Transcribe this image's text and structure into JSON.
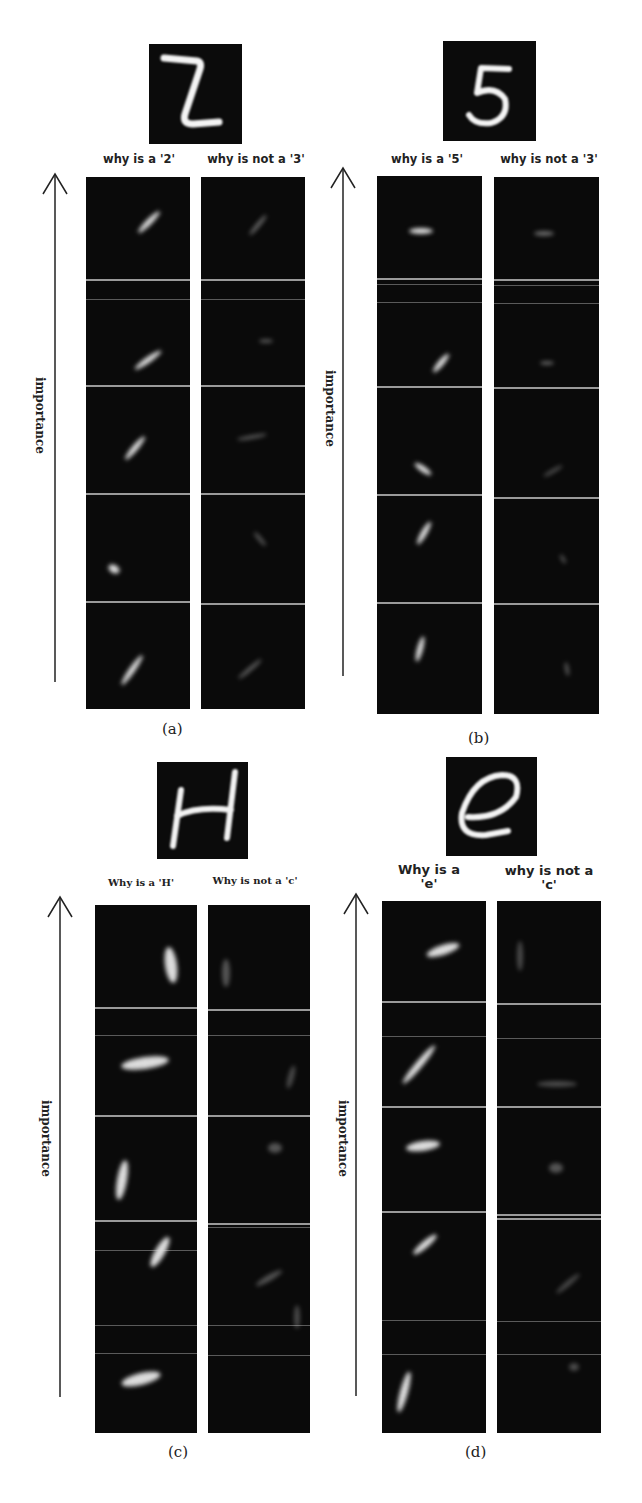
{
  "figure": {
    "axis_label": "importance",
    "panels": [
      {
        "id": "a",
        "caption": "(a)",
        "input_glyph": "2",
        "headers": [
          "why is a '2'",
          "why is not a '3'"
        ],
        "rows": 5
      },
      {
        "id": "b",
        "caption": "(b)",
        "input_glyph": "5",
        "headers": [
          "why is a '5'",
          "why is not a '3'"
        ],
        "rows": 5
      },
      {
        "id": "c",
        "caption": "(c)",
        "input_glyph": "H",
        "headers": [
          "Why is a 'H'",
          "Why is not a 'c'"
        ],
        "rows": 5
      },
      {
        "id": "d",
        "caption": "(d)",
        "input_glyph": "e",
        "headers": [
          "Why is a 'e'",
          "why is not a 'c'"
        ],
        "header_lines": [
          [
            "Why is a",
            "'e'"
          ],
          [
            "why is not a",
            "'c'"
          ]
        ],
        "rows": 5
      }
    ]
  }
}
